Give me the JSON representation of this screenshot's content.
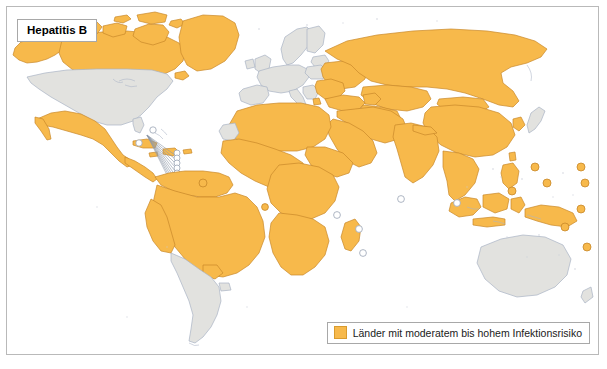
{
  "figure": {
    "type": "choropleth-world-map",
    "width": 607,
    "height": 369,
    "background": "#ffffff",
    "frame_color": "#b9b9b9"
  },
  "title": {
    "text": "Hepatitis B"
  },
  "legend": {
    "swatch_color": "#f7b94b",
    "swatch_border": "#d99b2e",
    "label": "Länder mit moderatem bis hohem Infektionsrisiko"
  },
  "colors": {
    "highlight_fill": "#f7b94b",
    "highlight_border": "#c8882a",
    "neutral_fill": "#e2e2df",
    "neutral_border": "#a9b3c4",
    "ocean": "#ffffff",
    "coastline": "#aab4c6",
    "leader_line": "#8f98a8"
  },
  "map_data": {
    "projection": "equirectangular",
    "highlighted_label": "Länder mit moderatem bis hohem Infektionsrisiko",
    "highlighted_regions": [
      "Greenland",
      "Alaska",
      "Canada (north)",
      "Mexico",
      "Central America",
      "Caribbean islands",
      "Colombia",
      "Venezuela",
      "Guyana",
      "Suriname",
      "French Guiana",
      "Ecuador",
      "Peru",
      "Bolivia",
      "Brazil",
      "Paraguay",
      "Northern Africa",
      "Sub-Saharan Africa",
      "Madagascar",
      "Middle East",
      "Turkey",
      "Caucasus",
      "Russia",
      "Ukraine",
      "Belarus",
      "Romania",
      "Bulgaria",
      "Moldova",
      "Albania",
      "Central Asia",
      "China",
      "Mongolia",
      "Korea",
      "India",
      "Pakistan",
      "Southeast Asia",
      "Indonesia",
      "Philippines",
      "Papua New Guinea",
      "Pacific islands",
      "Cape Verde"
    ],
    "neutral_regions": [
      "United States (contiguous)",
      "Southern Canada",
      "Argentina",
      "Chile",
      "Uruguay",
      "Western Europe",
      "Scandinavia",
      "Australia",
      "New Zealand",
      "Japan",
      "Mauritius",
      "Seychelles",
      "Réunion"
    ],
    "island_markers": [
      {
        "name": "Cape Verde",
        "highlighted": true
      },
      {
        "name": "São Tomé and Príncipe",
        "highlighted": true
      },
      {
        "name": "Comoros",
        "highlighted": false
      },
      {
        "name": "Seychelles",
        "highlighted": false
      },
      {
        "name": "Mauritius",
        "highlighted": false
      },
      {
        "name": "Réunion",
        "highlighted": false
      },
      {
        "name": "Maldives",
        "highlighted": false
      },
      {
        "name": "Singapore",
        "highlighted": false
      },
      {
        "name": "Palau",
        "highlighted": true
      },
      {
        "name": "Micronesia",
        "highlighted": true
      },
      {
        "name": "Marshall Islands",
        "highlighted": true
      },
      {
        "name": "Nauru",
        "highlighted": true
      },
      {
        "name": "Kiribati",
        "highlighted": true
      },
      {
        "name": "Solomon Islands",
        "highlighted": true
      },
      {
        "name": "Vanuatu",
        "highlighted": true
      },
      {
        "name": "Fiji",
        "highlighted": true
      },
      {
        "name": "Bahamas",
        "highlighted": false
      },
      {
        "name": "Lesser Antilles",
        "highlighted": false
      }
    ]
  }
}
